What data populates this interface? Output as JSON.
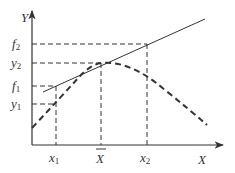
{
  "diagram": {
    "type": "function-tangent-diagram",
    "axes": {
      "y_label": "Y",
      "x_label": "X"
    },
    "y_ticks": [
      {
        "name": "f2",
        "base": "f",
        "sub": "2",
        "y": 44
      },
      {
        "name": "y2",
        "base": "y",
        "sub": "2",
        "y": 63
      },
      {
        "name": "f1",
        "base": "f",
        "sub": "1",
        "y": 86
      },
      {
        "name": "y1",
        "base": "y",
        "sub": "1",
        "y": 104
      }
    ],
    "x_ticks": [
      {
        "name": "x1",
        "base": "x",
        "sub": "1",
        "x": 56
      },
      {
        "name": "xbar",
        "base": "X",
        "sub": "",
        "overbar": true,
        "x": 101
      },
      {
        "name": "x2",
        "base": "x",
        "sub": "2",
        "x": 147
      }
    ],
    "curves": {
      "tangent_line": {
        "style": "solid",
        "from": [
          43,
          92
        ],
        "to": [
          205,
          19
        ]
      },
      "concave_function": {
        "style": "dashed",
        "peak_at": "xbar"
      }
    },
    "colors": {
      "ink": "#333333",
      "background": "#ffffff"
    }
  }
}
